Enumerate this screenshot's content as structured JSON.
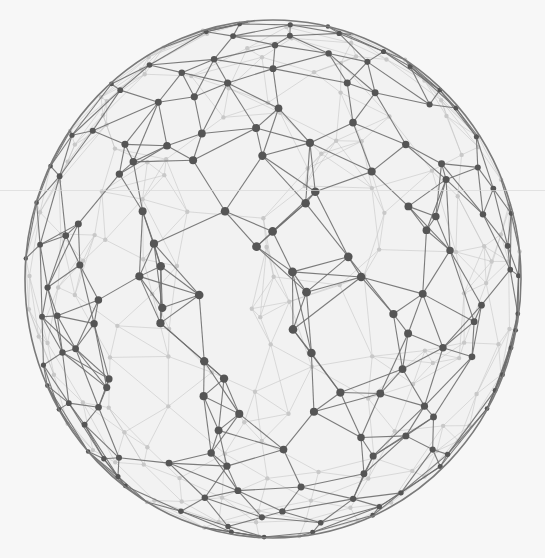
{
  "canvas": {
    "width": 545,
    "height": 558,
    "background": "#f7f7f7"
  },
  "sphere": {
    "cx": 273,
    "cy": 279,
    "rx": 248,
    "ry": 259,
    "fill": "#f2f2f2",
    "outline_color": "#7a7a7a",
    "front_line_color": "#6e6e6e",
    "back_line_color": "#c4c4c4",
    "front_node_color": "#555555",
    "back_node_color": "#c8c8c8",
    "node_count": 300,
    "seed": 7
  },
  "artifact": {
    "scanline_y": 190
  }
}
